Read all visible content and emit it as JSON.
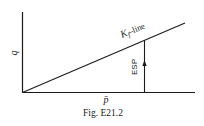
{
  "figure": {
    "caption": "Fig. E21.2",
    "y_axis_label": "q",
    "x_axis_label": "p̄",
    "line_label_main": "K",
    "line_label_sub": "f",
    "line_label_suffix": "–line",
    "path_label": "ESP",
    "colors": {
      "ink": "#1a1a1a",
      "background": "#ffffff"
    }
  }
}
